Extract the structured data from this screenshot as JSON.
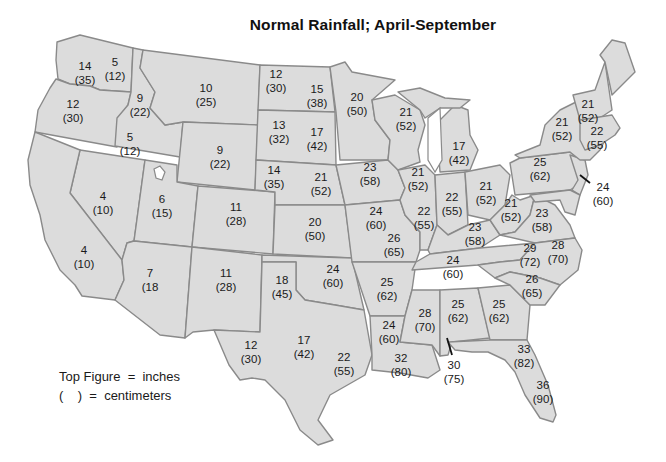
{
  "title": "Normal Rainfall; April-September",
  "legend": {
    "line1": "Top Figure  =  inches",
    "line2": "(    )  =  centimeters"
  },
  "colors": {
    "land": "#dcdcdc",
    "border": "#8a8a8a",
    "water": "#ffffff",
    "text": "#1a1a1a"
  },
  "states": [
    {
      "id": "wa-west",
      "inches": "14",
      "cm": "(35)"
    },
    {
      "id": "wa-east",
      "inches": "5",
      "cm": "(12)"
    },
    {
      "id": "or",
      "inches": "12",
      "cm": "(30)"
    },
    {
      "id": "id-north",
      "inches": "9",
      "cm": "(22)"
    },
    {
      "id": "id-south",
      "inches": "5",
      "cm": "(12)"
    },
    {
      "id": "mt",
      "inches": "10",
      "cm": "(25)"
    },
    {
      "id": "wy",
      "inches": "9",
      "cm": "(22)"
    },
    {
      "id": "nv",
      "inches": "4",
      "cm": "(10)"
    },
    {
      "id": "ca",
      "inches": "4",
      "cm": "(10)"
    },
    {
      "id": "ut",
      "inches": "6",
      "cm": "(15)"
    },
    {
      "id": "co",
      "inches": "11",
      "cm": "(28)"
    },
    {
      "id": "az",
      "inches": "7",
      "cm": "(18"
    },
    {
      "id": "nm",
      "inches": "11",
      "cm": "(28)"
    },
    {
      "id": "nd-west",
      "inches": "12",
      "cm": "(30)"
    },
    {
      "id": "nd-east",
      "inches": "15",
      "cm": "(38)"
    },
    {
      "id": "sd-west",
      "inches": "13",
      "cm": "(32)"
    },
    {
      "id": "sd-east",
      "inches": "17",
      "cm": "(42)"
    },
    {
      "id": "ne-west",
      "inches": "14",
      "cm": "(35)"
    },
    {
      "id": "ne-east",
      "inches": "21",
      "cm": "(52)"
    },
    {
      "id": "ks",
      "inches": "20",
      "cm": "(50)"
    },
    {
      "id": "ok-west",
      "inches": "18",
      "cm": "(45)"
    },
    {
      "id": "ok-east",
      "inches": "24",
      "cm": "(60)"
    },
    {
      "id": "tx-west",
      "inches": "12",
      "cm": "(30)"
    },
    {
      "id": "tx-central",
      "inches": "17",
      "cm": "(42)"
    },
    {
      "id": "tx-east",
      "inches": "22",
      "cm": "(55)"
    },
    {
      "id": "mn",
      "inches": "20",
      "cm": "(50)"
    },
    {
      "id": "ia",
      "inches": "23",
      "cm": "(58)"
    },
    {
      "id": "mo-north",
      "inches": "24",
      "cm": "(60)"
    },
    {
      "id": "mo-south",
      "inches": "26",
      "cm": "(65)"
    },
    {
      "id": "ar",
      "inches": "25",
      "cm": "(62)"
    },
    {
      "id": "la-north",
      "inches": "24",
      "cm": "(60)"
    },
    {
      "id": "la-south",
      "inches": "32",
      "cm": "(80)"
    },
    {
      "id": "wi",
      "inches": "21",
      "cm": "(52)"
    },
    {
      "id": "il-north",
      "inches": "21",
      "cm": "(52)"
    },
    {
      "id": "il-south",
      "inches": "22",
      "cm": "(55)"
    },
    {
      "id": "mi",
      "inches": "17",
      "cm": "(42)"
    },
    {
      "id": "in",
      "inches": "22",
      "cm": "(55)"
    },
    {
      "id": "oh",
      "inches": "21",
      "cm": "(52)"
    },
    {
      "id": "ky",
      "inches": "23",
      "cm": "(58)"
    },
    {
      "id": "tn",
      "inches": "24",
      "cm": "(60)"
    },
    {
      "id": "ms",
      "inches": "28",
      "cm": "(70)"
    },
    {
      "id": "al",
      "inches": "25",
      "cm": "(62)"
    },
    {
      "id": "ga",
      "inches": "25",
      "cm": "(62)"
    },
    {
      "id": "gulf-coast",
      "inches": "30",
      "cm": "(75)"
    },
    {
      "id": "fl-north",
      "inches": "33",
      "cm": "(82)"
    },
    {
      "id": "fl-south",
      "inches": "36",
      "cm": "(90)"
    },
    {
      "id": "sc",
      "inches": "26",
      "cm": "(65)"
    },
    {
      "id": "nc-west",
      "inches": "29",
      "cm": "(72)"
    },
    {
      "id": "nc-east",
      "inches": "28",
      "cm": "(70)"
    },
    {
      "id": "wv",
      "inches": "21",
      "cm": "(52)"
    },
    {
      "id": "va",
      "inches": "23",
      "cm": "(58)"
    },
    {
      "id": "pa",
      "inches": "25",
      "cm": "(62)"
    },
    {
      "id": "nj",
      "inches": "24",
      "cm": "(60)"
    },
    {
      "id": "ny",
      "inches": "21",
      "cm": "(52)"
    },
    {
      "id": "vt-nh",
      "inches": "21",
      "cm": "(52)"
    },
    {
      "id": "ma-ct-ri",
      "inches": "22",
      "cm": "(55)"
    }
  ]
}
